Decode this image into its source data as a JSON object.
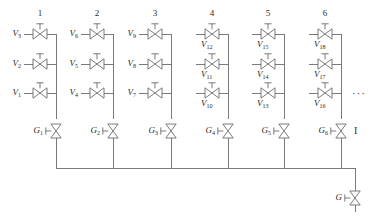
{
  "figure": {
    "type": "valve-manifold-schematic",
    "line_color": "#6b6b6b",
    "text_color": "#2b2b2b",
    "background": "#ffffff",
    "ellipsis": "···",
    "continuation_marker": "I"
  },
  "columns": [
    {
      "number": "1",
      "x": 40,
      "bus_x": 56,
      "valves": [
        {
          "id": "V1",
          "base": "V",
          "sub": "1",
          "row": 3,
          "y": 93,
          "label_side": "left"
        },
        {
          "id": "V2",
          "base": "V",
          "sub": "2",
          "row": 2,
          "y": 64,
          "label_side": "left"
        },
        {
          "id": "V3",
          "base": "V",
          "sub": "3",
          "row": 1,
          "y": 34,
          "label_side": "left"
        }
      ]
    },
    {
      "number": "2",
      "x": 97,
      "bus_x": 113,
      "valves": [
        {
          "id": "V4",
          "base": "V",
          "sub": "4",
          "row": 3,
          "y": 93,
          "label_side": "left"
        },
        {
          "id": "V5",
          "base": "V",
          "sub": "5",
          "row": 2,
          "y": 64,
          "label_side": "left"
        },
        {
          "id": "V6",
          "base": "V",
          "sub": "6",
          "row": 1,
          "y": 34,
          "label_side": "left"
        }
      ]
    },
    {
      "number": "3",
      "x": 155,
      "bus_x": 171,
      "valves": [
        {
          "id": "V7",
          "base": "V",
          "sub": "7",
          "row": 3,
          "y": 93,
          "label_side": "left"
        },
        {
          "id": "V8",
          "base": "V",
          "sub": "8",
          "row": 2,
          "y": 64,
          "label_side": "left"
        },
        {
          "id": "V9",
          "base": "V",
          "sub": "9",
          "row": 1,
          "y": 34,
          "label_side": "left"
        }
      ]
    },
    {
      "number": "4",
      "x": 212,
      "bus_x": 228,
      "valves": [
        {
          "id": "V10",
          "base": "V",
          "sub": "10",
          "row": 3,
          "y": 93,
          "label_side": "below"
        },
        {
          "id": "V11",
          "base": "V",
          "sub": "11",
          "row": 2,
          "y": 64,
          "label_side": "below"
        },
        {
          "id": "V12",
          "base": "V",
          "sub": "12",
          "row": 1,
          "y": 34,
          "label_side": "below"
        }
      ]
    },
    {
      "number": "5",
      "x": 268,
      "bus_x": 284,
      "valves": [
        {
          "id": "V13",
          "base": "V",
          "sub": "13",
          "row": 3,
          "y": 93,
          "label_side": "below"
        },
        {
          "id": "V14",
          "base": "V",
          "sub": "14",
          "row": 2,
          "y": 64,
          "label_side": "below"
        },
        {
          "id": "V15",
          "base": "V",
          "sub": "15",
          "row": 1,
          "y": 34,
          "label_side": "below"
        }
      ]
    },
    {
      "number": "6",
      "x": 325,
      "bus_x": 341,
      "valves": [
        {
          "id": "V16",
          "base": "V",
          "sub": "16",
          "row": 3,
          "y": 93,
          "label_side": "below"
        },
        {
          "id": "V17",
          "base": "V",
          "sub": "17",
          "row": 2,
          "y": 64,
          "label_side": "below"
        },
        {
          "id": "V18",
          "base": "V",
          "sub": "18",
          "row": 1,
          "y": 34,
          "label_side": "below"
        }
      ]
    }
  ],
  "gate_valves": [
    {
      "id": "G1",
      "base": "G",
      "sub": "1",
      "x": 56,
      "y": 131
    },
    {
      "id": "G2",
      "base": "G",
      "sub": "2",
      "x": 113,
      "y": 131
    },
    {
      "id": "G3",
      "base": "G",
      "sub": "3",
      "x": 171,
      "y": 131
    },
    {
      "id": "G4",
      "base": "G",
      "sub": "4",
      "x": 228,
      "y": 131
    },
    {
      "id": "G5",
      "base": "G",
      "sub": "5",
      "x": 284,
      "y": 131
    },
    {
      "id": "G6",
      "base": "G",
      "sub": "6",
      "x": 341,
      "y": 131
    }
  ],
  "outlet_valve": {
    "id": "G",
    "base": "G",
    "sub": "",
    "x": 355,
    "y": 198
  },
  "bottom_bus": {
    "y": 168,
    "x_start": 56,
    "x_end": 355
  },
  "rows": [
    {
      "index": 1,
      "y": 34
    },
    {
      "index": 2,
      "y": 64
    },
    {
      "index": 3,
      "y": 93
    }
  ]
}
